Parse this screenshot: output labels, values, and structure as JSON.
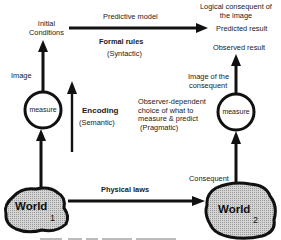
{
  "diagram": {
    "top": {
      "initial_conditions": [
        "Initial",
        "Conditions"
      ],
      "predictive_model": "Predictive model",
      "formal_rules": "Formal rules",
      "syntactic": "(Syntactic)",
      "logical_consequent": [
        "Logical consequent of",
        "the image"
      ],
      "predicted_result": "Predicted result",
      "observed_result": "Observed result"
    },
    "left": {
      "image_label": "Image",
      "measure_label": "measure",
      "encoding": "Encoding",
      "semantic": "(Semantic)"
    },
    "right": {
      "image_of_consequent": [
        "Image of the",
        "consequent"
      ],
      "measure_label": "measure",
      "observer_dependent": [
        "Observer-dependent",
        "choice of what to",
        "measure & predict",
        " (Pragmatic)"
      ]
    },
    "bottom": {
      "world1": {
        "name": "World",
        "subscript": "1"
      },
      "world2": {
        "name": "World",
        "subscript": "2"
      },
      "physical_laws": "Physical laws",
      "consequent": "Consequent"
    },
    "colors": {
      "ink": "#111111",
      "world_fill": "#c8c8c8",
      "background": "#ffffff"
    }
  }
}
